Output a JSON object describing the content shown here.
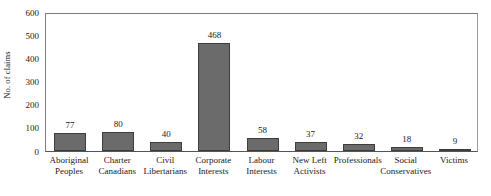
{
  "chart_data": {
    "type": "bar",
    "title": "",
    "subtitle": "",
    "xlabel": "",
    "ylabel": "No. of claims",
    "ylim": [
      0,
      600
    ],
    "ytick_labels": [
      "600",
      "500",
      "400",
      "300",
      "200",
      "100",
      "0"
    ],
    "yticks": [
      600,
      500,
      400,
      300,
      200,
      100,
      0
    ],
    "grid": false,
    "legend": null,
    "legend_position": "none",
    "bar_color": "#6b6b6b",
    "bar_edge_color": "#3d3d3d",
    "axis_color": "#808080",
    "categories": [
      "Aboriginal Peoples",
      "Charter Canadians",
      "Civil Libertarians",
      "Corporate Interests",
      "Labour Interests",
      "New Left Activists",
      "Professionals",
      "Social Conservatives",
      "Victims"
    ],
    "category_lines": [
      [
        "Aboriginal",
        "Peoples"
      ],
      [
        "Charter",
        "Canadians"
      ],
      [
        "Civil",
        "Libertarians"
      ],
      [
        "Corporate",
        "Interests"
      ],
      [
        "Labour",
        "Interests"
      ],
      [
        "New Left",
        "Activists"
      ],
      [
        "Professionals",
        ""
      ],
      [
        "Social",
        "Conservatives"
      ],
      [
        "Victims",
        ""
      ]
    ],
    "values": [
      77,
      80,
      40,
      468,
      58,
      37,
      32,
      18,
      9
    ],
    "value_labels": [
      "77",
      "80",
      "40",
      "468",
      "58",
      "37",
      "32",
      "18",
      "9"
    ]
  }
}
